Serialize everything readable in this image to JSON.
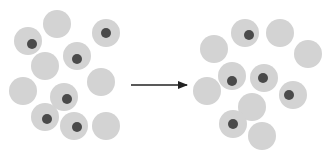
{
  "diagram": {
    "colors": {
      "circle_fill": "#d3d3d3",
      "dot_fill": "#4a4a4a",
      "arrow": "#222222"
    },
    "left_cluster": {
      "circles": [
        {
          "has_dot": false
        },
        {
          "has_dot": true
        },
        {
          "has_dot": true
        },
        {
          "has_dot": true
        },
        {
          "has_dot": false
        },
        {
          "has_dot": false
        },
        {
          "has_dot": false
        },
        {
          "has_dot": true
        },
        {
          "has_dot": true
        },
        {
          "has_dot": true
        },
        {
          "has_dot": false
        }
      ]
    },
    "right_cluster": {
      "circles": [
        {
          "has_dot": true
        },
        {
          "has_dot": false
        },
        {
          "has_dot": false
        },
        {
          "has_dot": false
        },
        {
          "has_dot": true
        },
        {
          "has_dot": true
        },
        {
          "has_dot": false
        },
        {
          "has_dot": true
        },
        {
          "has_dot": false
        },
        {
          "has_dot": true
        },
        {
          "has_dot": false
        }
      ]
    },
    "arrow": {
      "direction": "right"
    }
  }
}
